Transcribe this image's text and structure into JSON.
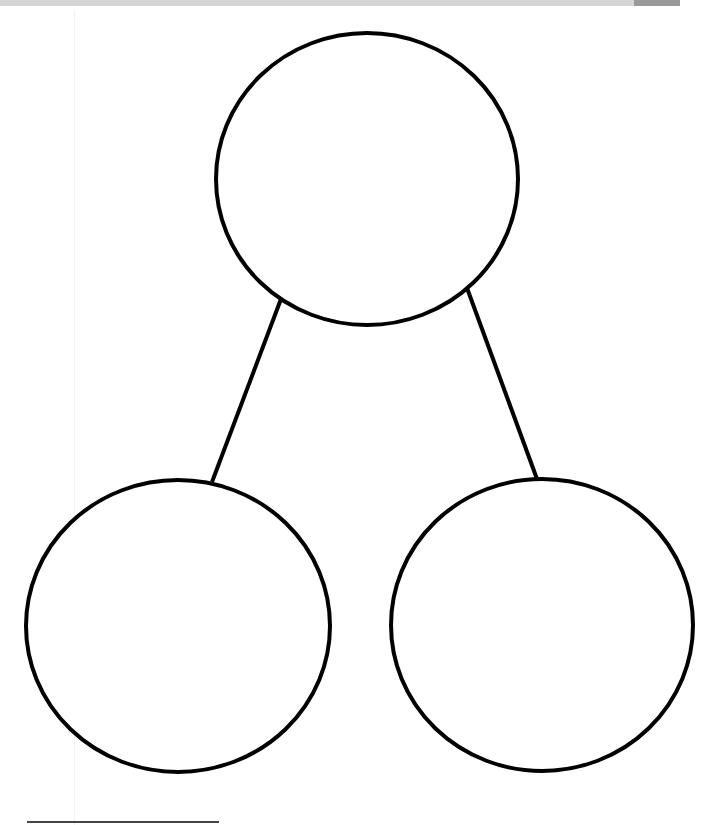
{
  "header": {
    "title": "",
    "bar_color": "#d6d6d6",
    "tab_color": "#9a9a9a"
  },
  "diagram": {
    "type": "number-bond",
    "stroke_color": "#000000",
    "stroke_width": 4,
    "circles": [
      {
        "id": "whole",
        "label": "",
        "cx": 367,
        "cy": 179,
        "rx": 151,
        "ry": 146
      },
      {
        "id": "part-left",
        "label": "",
        "cx": 178,
        "cy": 626,
        "rx": 152,
        "ry": 146
      },
      {
        "id": "part-right",
        "label": "",
        "cx": 542,
        "cy": 625,
        "rx": 151,
        "ry": 146
      }
    ],
    "connectors": [
      {
        "id": "left-connector",
        "x1": 281,
        "y1": 299,
        "x2": 212,
        "y2": 482
      },
      {
        "id": "right-connector",
        "x1": 467,
        "y1": 288,
        "x2": 537,
        "y2": 479
      }
    ]
  },
  "footer": {
    "rule_color": "#444444"
  }
}
